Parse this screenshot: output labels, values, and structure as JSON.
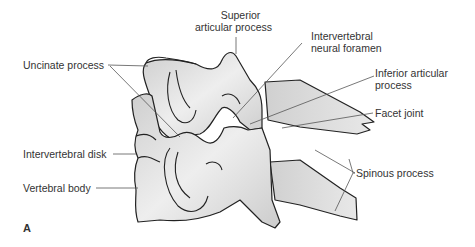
{
  "figure": {
    "panel_letter": "A",
    "colors": {
      "bone_fill": "#d9d9d9",
      "bone_light": "#eeeeee",
      "outline": "#222222",
      "leader": "#555555",
      "text": "#333333"
    }
  },
  "labels": {
    "superior_articular_process": {
      "line1": "Superior",
      "line2": "articular process"
    },
    "intervertebral_neural_foramen": {
      "line1": "Intervertebral",
      "line2": "neural foramen"
    },
    "inferior_articular_process": {
      "line1": "Inferior articular",
      "line2": "process"
    },
    "facet_joint": "Facet joint",
    "uncinate_process": "Uncinate process",
    "intervertebral_disk": "Intervertebral disk",
    "vertebral_body": "Vertebral body",
    "spinous_process": "Spinous process"
  }
}
